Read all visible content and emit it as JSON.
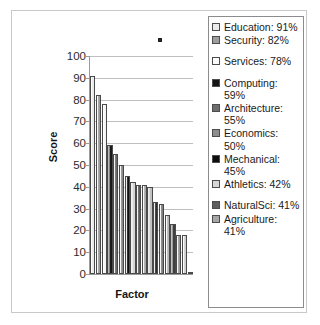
{
  "chart_data": {
    "type": "bar",
    "title": "",
    "xlabel": "Factor",
    "ylabel": "Score",
    "ylim": [
      0,
      100
    ],
    "ytick_labels": [
      "100",
      "90",
      "80",
      "70",
      "60",
      "50",
      "40",
      "30",
      "20",
      "10",
      "0"
    ],
    "ytick_values": [
      100,
      90,
      80,
      70,
      60,
      50,
      40,
      30,
      20,
      10,
      0
    ],
    "grid": true,
    "legend_position": "right",
    "categories": [
      "Education",
      "Security",
      "Services",
      "Computing",
      "Architecture",
      "Economics",
      "Mechanical",
      "Athletics",
      "NaturalSci",
      "Agriculture",
      "Bar11",
      "Bar12",
      "Bar13",
      "Bar14",
      "Bar15",
      "Bar16",
      "Bar17",
      "Bar18"
    ],
    "values": [
      91,
      82,
      78,
      59,
      55,
      50,
      45,
      42,
      41,
      41,
      40,
      33,
      32,
      27,
      23,
      18,
      18,
      1
    ],
    "bar_colors": [
      "#e8e8e8",
      "#9d9d9d",
      "#f4f4f4",
      "#1a1a1a",
      "#6b6b6b",
      "#8a8a8a",
      "#111111",
      "#d4d4d4",
      "#5c5c5c",
      "#a8a8a8",
      "#c2c2c2",
      "#2e2e2e",
      "#7d7d7d",
      "#b5b5b5",
      "#3f3f3f",
      "#9a9a9a",
      "#cfcfcf",
      "#555555"
    ]
  },
  "legend": {
    "items": [
      {
        "label": "Education: 91%",
        "swatch": "#ececec",
        "spaced": false
      },
      {
        "label": "Security: 82%",
        "swatch": "#9e9e9e",
        "spaced": false
      },
      {
        "label": "Services: 78%",
        "swatch": "#fbfbfb",
        "spaced": true
      },
      {
        "label": "Computing: 59%",
        "swatch": "#151515",
        "spaced": true
      },
      {
        "label": "Architecture: 55%",
        "swatch": "#6e6e6e",
        "spaced": false
      },
      {
        "label": "Economics: 50%",
        "swatch": "#8d8d8d",
        "spaced": false
      },
      {
        "label": "Mechanical: 45%",
        "swatch": "#0d0d0d",
        "spaced": false
      },
      {
        "label": "Athletics: 42%",
        "swatch": "#d6d6d6",
        "spaced": false
      },
      {
        "label": "NaturalSci: 41%",
        "swatch": "#5e5e5e",
        "spaced": true
      },
      {
        "label": "Agriculture: 41%",
        "swatch": "#a6a6a6",
        "spaced": false
      }
    ]
  },
  "colors": {
    "gridline": "#bfbfbf",
    "axis": "#9a9a9a",
    "text": "#1a1a1a",
    "frame": "#c9c9c9",
    "legend_border": "#8c8c8c",
    "background": "#ffffff"
  }
}
